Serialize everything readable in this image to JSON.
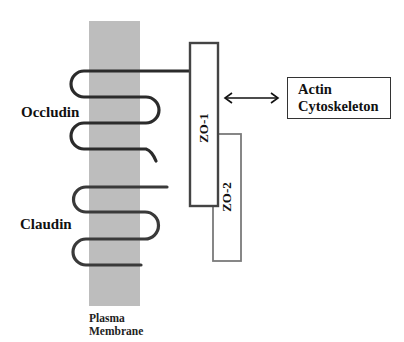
{
  "diagram": {
    "type": "tight-junction-schematic",
    "labels": {
      "occludin": "Occludin",
      "claudin": "Claudin",
      "plasma_membrane_line1": "Plasma",
      "plasma_membrane_line2": "Membrane",
      "zo1": "ZO-1",
      "zo2": "ZO-2",
      "actin_line1": "Actin",
      "actin_line2": "Cytoskeleton"
    },
    "colors": {
      "membrane": "#bdbdbd",
      "protein_strand": "#2b2b2b",
      "box_stroke": "#444444",
      "zo2_stroke": "#7a7a7a",
      "background": "#ffffff"
    },
    "relations": [
      {
        "from": "Occludin",
        "to": "ZO-1",
        "type": "line"
      },
      {
        "from": "ZO-1",
        "to": "Actin Cytoskeleton",
        "type": "double-arrow"
      },
      {
        "from": "ZO-1",
        "to": "ZO-2",
        "type": "overlap"
      }
    ]
  }
}
